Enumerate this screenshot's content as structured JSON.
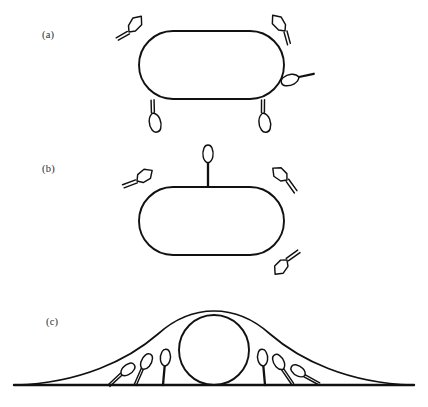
{
  "figure": {
    "background_color": "#ffffff",
    "ink_color": "#111111",
    "width": 428,
    "height": 407,
    "panels": [
      {
        "id": "a",
        "label": "(a)",
        "label_x": 42,
        "label_y": 38,
        "description": "Rod-shaped (capsule) cell outline with five detached leaf-shaped appendages arranged around it",
        "cell": {
          "shape": "stadium",
          "x": 139,
          "y": 31,
          "width": 145,
          "height": 68,
          "radius": 34
        },
        "appendages": [
          {
            "name": "appendage-a-top-left",
            "cx": 129,
            "cy": 32,
            "angle": 38,
            "head_length": 21,
            "head_width": 11,
            "stalk_length": 13,
            "stalk_style": "double"
          },
          {
            "name": "appendage-a-top-right",
            "cx": 285,
            "cy": 31,
            "angle": -38,
            "head_length": 21,
            "head_width": 11,
            "stalk_length": 13,
            "stalk_style": "double"
          },
          {
            "name": "appendage-a-right-mid",
            "cx": 299,
            "cy": 77,
            "angle": -108,
            "head_length": 20,
            "head_width": 10,
            "stalk_length": 15,
            "stalk_style": "thick"
          },
          {
            "name": "appendage-a-bottom-left",
            "cx": 153,
            "cy": 113,
            "angle": 168,
            "head_length": 21,
            "head_width": 11,
            "stalk_length": 13,
            "stalk_style": "double"
          },
          {
            "name": "appendage-a-bottom-right",
            "cx": 263,
            "cy": 113,
            "angle": 170,
            "head_length": 21,
            "head_width": 11,
            "stalk_length": 13,
            "stalk_style": "double"
          }
        ]
      },
      {
        "id": "b",
        "label": "(b)",
        "label_x": 42,
        "label_y": 172,
        "description": "Same rod-shaped cell with four leaf-shaped appendages attached to the cell envelope by short stalks",
        "cell": {
          "shape": "stadium",
          "x": 139,
          "y": 187,
          "width": 145,
          "height": 68,
          "radius": 34
        },
        "appendages": [
          {
            "name": "appendage-b-upper-left",
            "cx": 137,
            "cy": 181,
            "angle": 55,
            "head_length": 19,
            "head_width": 11,
            "stalk_length": 14,
            "stalk_style": "double"
          },
          {
            "name": "appendage-b-top-center",
            "cx": 208,
            "cy": 163,
            "angle": 0,
            "head_length": 19,
            "head_width": 10,
            "stalk_length": 20,
            "stalk_style": "single"
          },
          {
            "name": "appendage-b-upper-right",
            "cx": 287,
            "cy": 180,
            "angle": -50,
            "head_length": 19,
            "head_width": 11,
            "stalk_length": 14,
            "stalk_style": "double"
          },
          {
            "name": "appendage-b-lower-right",
            "cx": 287,
            "cy": 260,
            "angle": -140,
            "head_length": 19,
            "head_width": 11,
            "stalk_length": 14,
            "stalk_style": "double"
          }
        ]
      },
      {
        "id": "c",
        "label": "(c)",
        "label_x": 46,
        "label_y": 325,
        "description": "Cross-section: circular cell on a flat substratum, enveloped by a bell-shaped mound, with six leaf-shaped appendages anchored to the baseline at increasing tilt away from the cell",
        "baseline": {
          "x1": 14,
          "x2": 414,
          "y": 385
        },
        "circle_cell": {
          "cx": 214,
          "cy": 350,
          "r": 35
        },
        "mound": {
          "left_x": 16,
          "right_x": 412,
          "apex_x": 214,
          "apex_y": 313,
          "baseline_y": 385
        },
        "appendages": [
          {
            "name": "appendage-c-left-1",
            "base_x": 108,
            "angle": 52,
            "head_length": 17,
            "head_width": 10,
            "stalk_length": 17,
            "stalk_style": "double"
          },
          {
            "name": "appendage-c-left-2",
            "base_x": 134,
            "angle": 28,
            "head_length": 18,
            "head_width": 10,
            "stalk_length": 18,
            "stalk_style": "double"
          },
          {
            "name": "appendage-c-left-3",
            "base_x": 163,
            "angle": 5,
            "head_length": 18,
            "head_width": 10,
            "stalk_length": 19,
            "stalk_style": "single"
          },
          {
            "name": "appendage-c-right-1",
            "base_x": 265,
            "angle": -5,
            "head_length": 18,
            "head_width": 10,
            "stalk_length": 19,
            "stalk_style": "single"
          },
          {
            "name": "appendage-c-right-2",
            "base_x": 292,
            "angle": -30,
            "head_length": 18,
            "head_width": 10,
            "stalk_length": 18,
            "stalk_style": "double"
          },
          {
            "name": "appendage-c-right-3",
            "base_x": 319,
            "angle": -56,
            "head_length": 17,
            "head_width": 10,
            "stalk_length": 17,
            "stalk_style": "double"
          }
        ]
      }
    ]
  }
}
